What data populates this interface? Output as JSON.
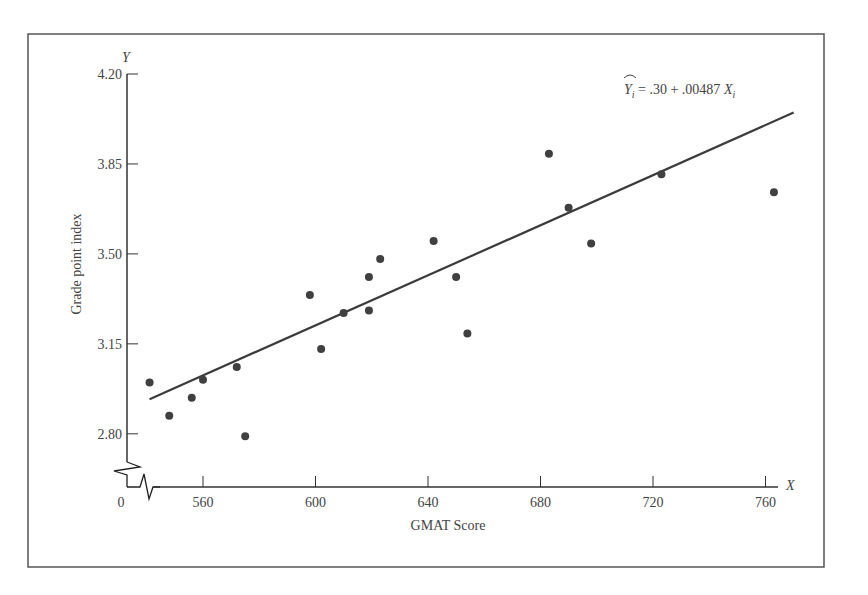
{
  "chart_data": {
    "type": "scatter",
    "title": "",
    "xlabel": "GMAT Score",
    "ylabel": "Grade point index",
    "x_axis_letter": "X",
    "y_axis_letter": "Y",
    "x_ticks": [
      560,
      600,
      640,
      680,
      720,
      760
    ],
    "x_origin_label": "0",
    "y_ticks": [
      2.8,
      3.15,
      3.5,
      3.85,
      4.2
    ],
    "y_tick_labels": [
      "2.80",
      "3.15",
      "3.50",
      "3.85",
      "4.20"
    ],
    "xlim": [
      540,
      770
    ],
    "ylim": [
      2.7,
      4.2
    ],
    "axis_break": true,
    "grid": false,
    "legend": null,
    "annotation": {
      "text_hat": "Y",
      "subscript": "i",
      "rest": " = .30 + .00487 ",
      "x_var": "X",
      "x_sub": "i"
    },
    "regression_line": {
      "intercept": 0.3,
      "slope": 0.00487,
      "x_start": 541,
      "x_end": 770
    },
    "points": [
      {
        "x": 541,
        "y": 3.0
      },
      {
        "x": 548,
        "y": 2.87
      },
      {
        "x": 556,
        "y": 2.94
      },
      {
        "x": 560,
        "y": 3.01
      },
      {
        "x": 572,
        "y": 3.06
      },
      {
        "x": 575,
        "y": 2.79
      },
      {
        "x": 598,
        "y": 3.34
      },
      {
        "x": 602,
        "y": 3.13
      },
      {
        "x": 610,
        "y": 3.27
      },
      {
        "x": 619,
        "y": 3.41
      },
      {
        "x": 619,
        "y": 3.28
      },
      {
        "x": 623,
        "y": 3.48
      },
      {
        "x": 642,
        "y": 3.55
      },
      {
        "x": 650,
        "y": 3.41
      },
      {
        "x": 654,
        "y": 3.19
      },
      {
        "x": 683,
        "y": 3.89
      },
      {
        "x": 690,
        "y": 3.68
      },
      {
        "x": 698,
        "y": 3.54
      },
      {
        "x": 723,
        "y": 3.81
      },
      {
        "x": 763,
        "y": 3.74
      }
    ],
    "colors": {
      "points": "#404040",
      "line": "#3c3c3c",
      "axis": "#333333",
      "frame": "#555555"
    }
  }
}
